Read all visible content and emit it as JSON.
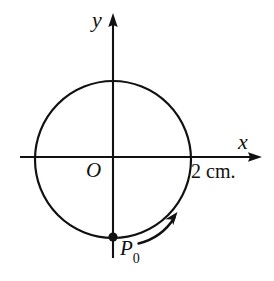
{
  "figure": {
    "background_color": "#ffffff",
    "ink_color": "#111111",
    "labels": {
      "y_axis": "y",
      "x_axis": "x",
      "origin": "O",
      "point": "P",
      "point_subscript": "0",
      "radius_annotation": "2 cm."
    },
    "geometry": {
      "origin_px": {
        "x": 113,
        "y": 157
      },
      "circle_radius_px": 78,
      "circle_center_px": {
        "x": 113,
        "y": 159
      },
      "x_axis": {
        "x1": 20,
        "x2": 262,
        "y": 157
      },
      "y_axis": {
        "x": 113,
        "y1": 13,
        "y2": 258
      },
      "point_marker_px": {
        "x": 113,
        "y": 237
      },
      "point_marker_radius_px": 4.5,
      "motion_arrow": {
        "start_px": {
          "x": 139,
          "y": 243
        },
        "end_px": {
          "x": 176,
          "y": 214
        },
        "direction": "counterclockwise"
      }
    },
    "values": {
      "radius": 2,
      "radius_units": "cm"
    }
  }
}
